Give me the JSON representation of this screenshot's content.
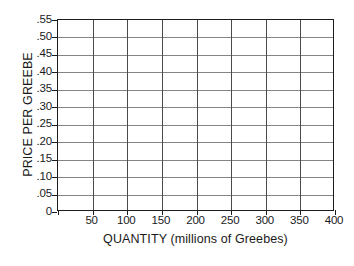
{
  "figure": {
    "clipped_top_text": "",
    "background_color": "#ffffff"
  },
  "chart_data": {
    "type": "line",
    "title": "",
    "subtitle": "",
    "xlabel": "QUANTITY (millions of Greebes)",
    "ylabel": "PRICE PER GREEBE",
    "xlim": [
      0,
      400
    ],
    "ylim": [
      0,
      0.55
    ],
    "x_ticks": [
      0,
      50,
      100,
      150,
      200,
      250,
      300,
      350,
      400
    ],
    "x_ticklabels": [
      "",
      "50",
      "100",
      "150",
      "200",
      "250",
      "300",
      "350",
      "400"
    ],
    "y_ticks": [
      0,
      0.05,
      0.1,
      0.15,
      0.2,
      0.25,
      0.3,
      0.35,
      0.4,
      0.45,
      0.5,
      0.55
    ],
    "y_ticklabels": [
      "0",
      ".05",
      ".10",
      ".15",
      ".20",
      ".25",
      ".30",
      ".35",
      ".40",
      ".45",
      ".50",
      ".55"
    ],
    "grid": true,
    "grid_columns": 8,
    "grid_rows": 11,
    "legend": null,
    "legend_position": "none",
    "series": [],
    "annotations": [],
    "note": "Empty blank grid worksheet; no data series are plotted.",
    "colors": {
      "axis": "#1c1c1c",
      "gridline_horizontal": "#848484",
      "gridline_vertical": "#4a4a4a",
      "text": "#1a1a1a",
      "plot_background": "#ffffff"
    }
  }
}
